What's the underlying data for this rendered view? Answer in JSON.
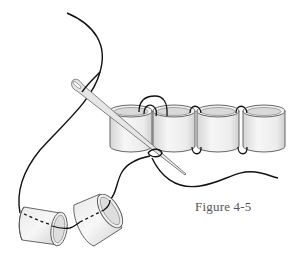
{
  "figure": {
    "caption": "Figure 4-5",
    "elements": {
      "bead_row_count": 4,
      "loose_bead_count": 2,
      "needle": "needle-icon",
      "thread": "thread-icon"
    }
  },
  "colors": {
    "background": "#ffffff",
    "thread": "#111111",
    "bead_outline": "#555555",
    "bead_fill_light": "#f4f4f4",
    "bead_fill_shade": "#d8d8d8",
    "needle": "#c8c8c8",
    "caption": "#555555"
  }
}
